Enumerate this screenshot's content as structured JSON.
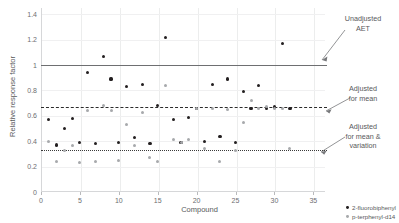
{
  "chart_data": {
    "type": "scatter",
    "title": "",
    "xlabel": "Compound",
    "ylabel": "Relative response factor",
    "xlim": [
      0,
      36.5
    ],
    "ylim": [
      0,
      1.45
    ],
    "xticks": [
      0,
      5,
      10,
      15,
      20,
      25,
      30,
      35
    ],
    "yticks": [
      0,
      0.2,
      0.4,
      0.6,
      0.8,
      1,
      1.2,
      1.4
    ],
    "ytick_labels": [
      "0",
      "0.2",
      "0.4",
      "0.6",
      "0.8",
      "1",
      "1.2",
      "1.4"
    ],
    "xtick_labels": [
      "0",
      "5",
      "10",
      "15",
      "20",
      "25",
      "30",
      "35"
    ],
    "grid": true,
    "legend_position": "bottom-right",
    "series": [
      {
        "name": "2-fluorobiphenyl",
        "marker": "filled-circle",
        "color": "#231f20",
        "x": [
          1,
          2,
          3,
          4,
          5,
          6,
          7,
          8,
          9,
          10,
          11,
          12,
          13,
          14,
          15,
          16,
          17,
          18,
          19,
          20,
          21,
          22,
          23,
          24,
          25,
          26,
          27,
          28,
          29,
          30,
          31,
          32
        ],
        "y": [
          0.57,
          0.37,
          0.5,
          0.58,
          0.39,
          0.94,
          0.38,
          1.07,
          0.89,
          0.39,
          0.83,
          0.43,
          0.85,
          0.38,
          0.68,
          1.22,
          0.57,
          0.39,
          0.59,
          0.66,
          0.4,
          0.85,
          0.44,
          0.89,
          0.39,
          0.79,
          0.66,
          0.84,
          0.66,
          0.67,
          1.17,
          0.66
        ]
      },
      {
        "name": "p-terphenyl-d14",
        "marker": "light-circle",
        "color": "#a7a9ac",
        "x": [
          1,
          2,
          3,
          4,
          5,
          6,
          7,
          8,
          9,
          10,
          11,
          12,
          13,
          14,
          15,
          16,
          17,
          18,
          19,
          20,
          21,
          22,
          23,
          24,
          25,
          26,
          27,
          28,
          29,
          30,
          31,
          32
        ],
        "y": [
          0.4,
          0.24,
          0.33,
          0.37,
          0.23,
          0.64,
          0.24,
          0.68,
          0.64,
          0.25,
          0.53,
          0.37,
          0.63,
          0.27,
          0.24,
          0.84,
          0.41,
          0.39,
          0.41,
          0.66,
          0.34,
          0.66,
          0.24,
          0.65,
          0.33,
          0.55,
          0.72,
          0.66,
          0.67,
          0.66,
          0.66,
          0.34
        ]
      }
    ],
    "reference_lines": [
      {
        "id": "unadjusted-aet",
        "label": "Unadjusted AET",
        "value": 1.0,
        "style": "solid",
        "color": "#6e6f71"
      },
      {
        "id": "adjusted-for-mean",
        "label": "Adjusted for mean",
        "value": 0.67,
        "style": "dashed",
        "color": "#2b2b2b"
      },
      {
        "id": "adjusted-for-mean-variation",
        "label": "Adjusted for mean & variation",
        "value": 0.33,
        "style": "dotted",
        "color": "#3a3a3a"
      }
    ],
    "annotations": [
      {
        "id": "unadjusted-aet-annotation",
        "line1": "Unadjusted",
        "line2": "AET",
        "line3": ""
      },
      {
        "id": "adjusted-mean-annotation",
        "line1": "Adjusted",
        "line2": "for mean",
        "line3": ""
      },
      {
        "id": "adjusted-mean-variation-annotation",
        "line1": "Adjusted",
        "line2": "for mean &",
        "line3": "variation"
      }
    ]
  },
  "legend": {
    "items": [
      {
        "label": "2-fluorobiphenyl"
      },
      {
        "label": "p-terphenyl-d14"
      }
    ]
  }
}
